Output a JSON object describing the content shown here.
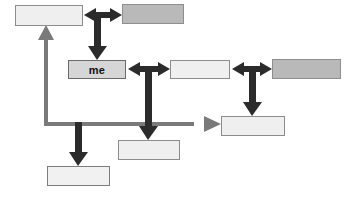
{
  "diagram": {
    "width": 353,
    "height": 197,
    "background": "#ffffff",
    "colors": {
      "arrow_black": "#2b2b2b",
      "arrow_gray": "#7a7a7a",
      "box_light": "#efefef",
      "box_mid": "#d6d6d6",
      "box_dark": "#b9b9b9",
      "box_border": "#6d6d6d",
      "text": "#111111"
    },
    "nodes": [
      {
        "id": "top-left",
        "label": "",
        "shade": "light",
        "x": 15,
        "y": 5,
        "w": 68,
        "h": 21
      },
      {
        "id": "top-right",
        "label": "",
        "shade": "dark",
        "x": 122,
        "y": 4,
        "w": 62,
        "h": 20
      },
      {
        "id": "me",
        "label": "me",
        "shade": "mid",
        "x": 68,
        "y": 60,
        "w": 58,
        "h": 19
      },
      {
        "id": "mid-center",
        "label": "",
        "shade": "light",
        "x": 170,
        "y": 60,
        "w": 60,
        "h": 19
      },
      {
        "id": "mid-right",
        "label": "",
        "shade": "dark",
        "x": 272,
        "y": 59,
        "w": 69,
        "h": 20
      },
      {
        "id": "lower-right",
        "label": "",
        "shade": "light",
        "x": 221,
        "y": 116,
        "w": 64,
        "h": 20
      },
      {
        "id": "bottom-center",
        "label": "",
        "shade": "light",
        "x": 118,
        "y": 140,
        "w": 62,
        "h": 20
      },
      {
        "id": "bottom-left",
        "label": "",
        "shade": "faint",
        "x": 47,
        "y": 166,
        "w": 63,
        "h": 20
      }
    ],
    "connectors": [
      {
        "id": "top-double-arrow",
        "kind": "double-horizontal",
        "color": "arrow_black"
      },
      {
        "id": "top-to-me-down-arrow",
        "kind": "down",
        "color": "arrow_black"
      },
      {
        "id": "me-to-center-double",
        "kind": "double-horizontal",
        "color": "arrow_black"
      },
      {
        "id": "center-to-right-double",
        "kind": "double-horizontal",
        "color": "arrow_black"
      },
      {
        "id": "center-down-arrow",
        "kind": "down",
        "color": "arrow_black"
      },
      {
        "id": "right-down-arrow",
        "kind": "down",
        "color": "arrow_black"
      },
      {
        "id": "left-branch-down-arrow",
        "kind": "down",
        "color": "arrow_black"
      },
      {
        "id": "feedback-up-arrow",
        "kind": "up",
        "color": "arrow_gray"
      },
      {
        "id": "feedback-right-arrow",
        "kind": "right",
        "color": "arrow_gray"
      },
      {
        "id": "feedback-baseline",
        "kind": "line-horizontal",
        "color": "arrow_gray"
      }
    ]
  }
}
